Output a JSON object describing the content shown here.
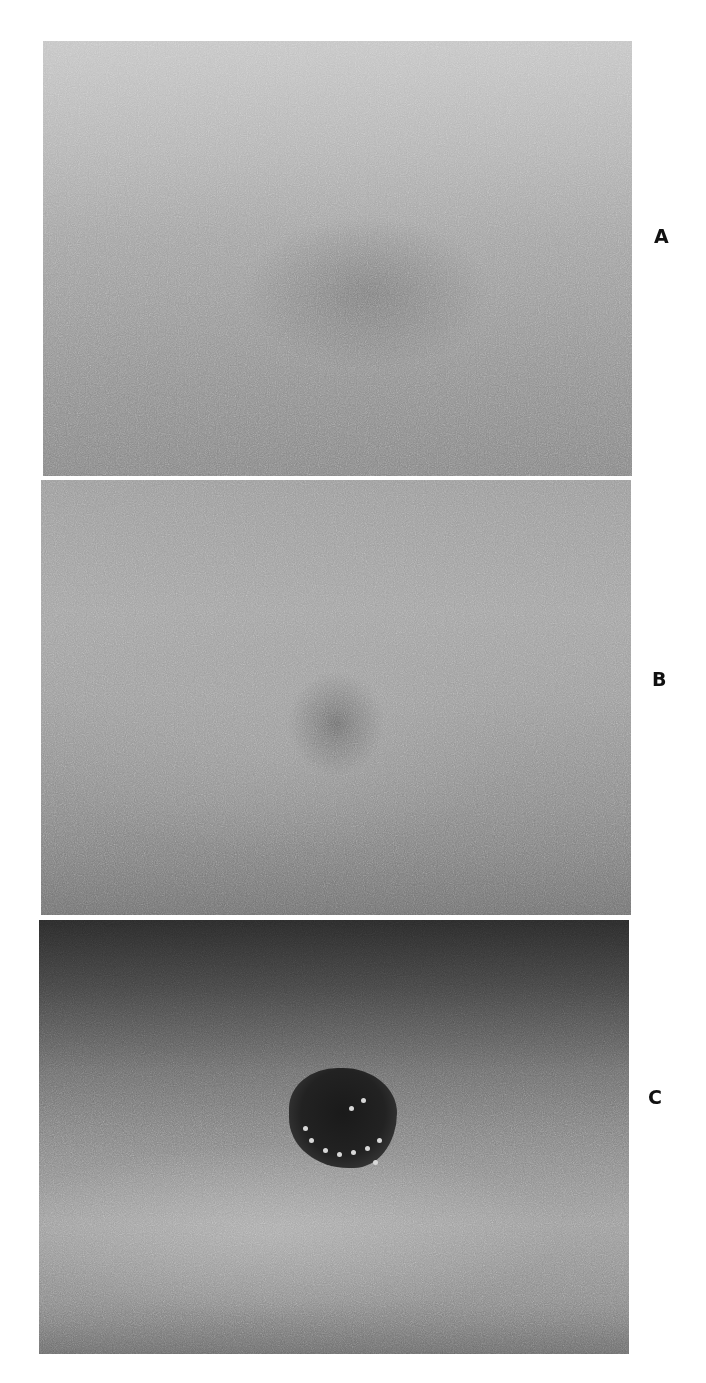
{
  "figure": {
    "panels": [
      {
        "id": "A",
        "label": "A",
        "description": "faint ill-defined pale gray patch on skin"
      },
      {
        "id": "B",
        "label": "B",
        "description": "small darker irregular macule on skin"
      },
      {
        "id": "C",
        "label": "C",
        "description": "dark pigmented nodular lesion with bright dotted surface on skin"
      }
    ],
    "colors": {
      "background": "#ffffff",
      "label": "#111111"
    }
  }
}
